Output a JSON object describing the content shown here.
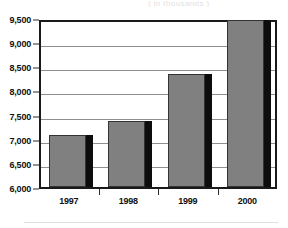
{
  "figure": {
    "title_remnant": "(   in   thousands   )",
    "footer_rule": ""
  },
  "chart_data": {
    "type": "bar",
    "title": "",
    "subtitle": "",
    "xlabel": "",
    "ylabel": "",
    "categories": [
      "1997",
      "1998",
      "1999",
      "2000"
    ],
    "values": [
      7080,
      7360,
      8350,
      9460
    ],
    "series": [
      {
        "name": "",
        "values": [
          7080,
          7360,
          8350,
          9460
        ]
      }
    ],
    "ylim": [
      6000,
      9500
    ],
    "ytick_values": [
      9500,
      9000,
      8500,
      8000,
      7500,
      7000,
      6500,
      6000
    ],
    "ytick_labels": [
      "9,500",
      "9,000",
      "8,500",
      "8,000",
      "7,500",
      "7,000",
      "6,500",
      "6,000"
    ],
    "xtick_labels": [
      "1997",
      "1998",
      "1999",
      "2000"
    ],
    "grid": true,
    "grid_axis": "y",
    "legend": false,
    "legend_position": "none",
    "annotations": [],
    "bar_fill_color": "#808080",
    "bar_edge_color": "#333333",
    "bar_shadow_color": "#0d0d0d",
    "gridline_color": "#8e8e8e",
    "frame_color": "#1a1a1a",
    "background_color": "#ffffff",
    "text_color": "#111111"
  }
}
